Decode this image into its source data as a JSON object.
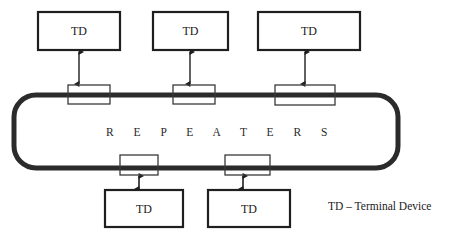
{
  "diagram": {
    "ring": {
      "label": "R E P E A T E R S",
      "stroke_color": "#2b2b2b",
      "stroke_width": 5,
      "corner_radius": 22,
      "x": 14,
      "y": 95,
      "width": 384,
      "height": 73
    },
    "terminal_devices": [
      {
        "id": "td-top-1",
        "label": "TD",
        "x": 38,
        "y": 12,
        "width": 82,
        "height": 38,
        "position": "top"
      },
      {
        "id": "td-top-2",
        "label": "TD",
        "x": 153,
        "y": 12,
        "width": 75,
        "height": 38,
        "position": "top"
      },
      {
        "id": "td-top-3",
        "label": "TD",
        "x": 258,
        "y": 12,
        "width": 102,
        "height": 38,
        "position": "top"
      },
      {
        "id": "td-bottom-1",
        "label": "TD",
        "x": 105,
        "y": 190,
        "width": 78,
        "height": 37,
        "position": "bottom"
      },
      {
        "id": "td-bottom-2",
        "label": "TD",
        "x": 208,
        "y": 190,
        "width": 82,
        "height": 37,
        "position": "bottom"
      }
    ],
    "repeaters": [
      {
        "id": "repeater-top-1",
        "x": 68,
        "y": 85,
        "width": 42,
        "height": 19,
        "edge": "top"
      },
      {
        "id": "repeater-top-2",
        "x": 173,
        "y": 85,
        "width": 42,
        "height": 19,
        "edge": "top"
      },
      {
        "id": "repeater-top-3",
        "x": 275,
        "y": 85,
        "width": 60,
        "height": 20,
        "edge": "top"
      },
      {
        "id": "repeater-bottom-1",
        "x": 120,
        "y": 155,
        "width": 38,
        "height": 20,
        "edge": "bottom"
      },
      {
        "id": "repeater-bottom-2",
        "x": 225,
        "y": 155,
        "width": 45,
        "height": 20,
        "edge": "bottom"
      }
    ],
    "connectors": [
      {
        "id": "connector-top-1",
        "x": 79,
        "y1": 50,
        "y2": 85,
        "type": "double-arrow"
      },
      {
        "id": "connector-top-2",
        "x": 190,
        "y1": 50,
        "y2": 85,
        "type": "double-arrow"
      },
      {
        "id": "connector-top-3",
        "x": 305,
        "y1": 50,
        "y2": 85,
        "type": "double-arrow"
      },
      {
        "id": "connector-bottom-1",
        "x": 139,
        "y1": 175,
        "y2": 190,
        "type": "double-arrow"
      },
      {
        "id": "connector-bottom-2",
        "x": 243,
        "y1": 175,
        "y2": 190,
        "type": "double-arrow"
      }
    ],
    "legend": {
      "text": "TD – Terminal Device",
      "x": 328,
      "y": 200
    },
    "colors": {
      "box_stroke": "#1f1f1f",
      "box_fill": "#ffffff",
      "repeater_stroke": "#3a3a3a",
      "ring_stroke": "#2b2b2b",
      "text": "#1a1a1a",
      "background": "#ffffff"
    }
  }
}
